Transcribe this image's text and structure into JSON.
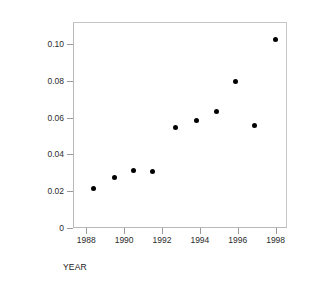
{
  "chart_data": {
    "type": "scatter",
    "title": "",
    "xlabel": "YEAR",
    "ylabel": "SEASON HOME RUN RATE",
    "xlim": [
      1987.3,
      1998.6
    ],
    "ylim": [
      0,
      0.112
    ],
    "grid": false,
    "legend": null,
    "marker": "filled-circle",
    "marker_color": "#000000",
    "xticks": [
      1988,
      1990,
      1992,
      1994,
      1996,
      1998
    ],
    "xtick_labels": [
      "1988",
      "1990",
      "1992",
      "1994",
      "1996",
      "1998"
    ],
    "yticks": [
      0,
      0.02,
      0.04,
      0.06,
      0.08,
      0.1
    ],
    "ytick_labels": [
      "0",
      "0.02",
      "0.04",
      "0.06",
      "0.08",
      "0.10"
    ],
    "x": [
      1988.4,
      1989.5,
      1990.5,
      1991.5,
      1992.7,
      1993.8,
      1994.9,
      1995.9,
      1996.9,
      1998.0
    ],
    "values": [
      0.0215,
      0.0275,
      0.0315,
      0.0305,
      0.0545,
      0.0585,
      0.0635,
      0.0795,
      0.0555,
      0.1025
    ],
    "points": [
      {
        "x": 1988.4,
        "y": 0.0215
      },
      {
        "x": 1989.5,
        "y": 0.0275
      },
      {
        "x": 1990.5,
        "y": 0.0315
      },
      {
        "x": 1991.5,
        "y": 0.0305
      },
      {
        "x": 1992.7,
        "y": 0.0545
      },
      {
        "x": 1993.8,
        "y": 0.0585
      },
      {
        "x": 1994.9,
        "y": 0.0635
      },
      {
        "x": 1995.9,
        "y": 0.0795
      },
      {
        "x": 1996.9,
        "y": 0.0555
      },
      {
        "x": 1998.0,
        "y": 0.1025
      }
    ]
  }
}
